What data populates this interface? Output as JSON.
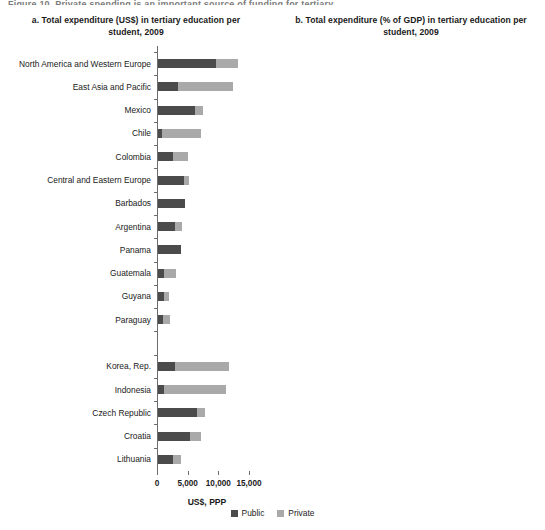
{
  "figure": {
    "top_cut_text": "Figure 10. Private spending is an important source of funding for tertiary education",
    "legend": [
      {
        "label": "Public",
        "color": "#4b4b4b",
        "key": "public"
      },
      {
        "label": "Private",
        "color": "#a9a9a9",
        "key": "private"
      }
    ]
  },
  "chart_data": [
    {
      "id": "panel-a",
      "type": "bar",
      "orientation": "horizontal",
      "stacked": true,
      "title": "a. Total expenditure (US$) in tertiary education per student, 2009",
      "xlabel": "US$, PPP",
      "ylabel": "",
      "xlim": [
        0,
        16300
      ],
      "xticks": [
        0,
        5000,
        10000,
        15000
      ],
      "xticklabels": [
        "0",
        "5,000",
        "10,000",
        "15,000"
      ],
      "grid": false,
      "legend_position": "bottom-center",
      "series": [
        {
          "name": "Public",
          "color": "#4b4b4b"
        },
        {
          "name": "Private",
          "color": "#a9a9a9"
        }
      ],
      "categories": [
        "North America and Western Europe",
        "East Asia and Pacific",
        "Mexico",
        "Chile",
        "Colombia",
        "Central and Eastern Europe",
        "Barbados",
        "Argentina",
        "Panama",
        "Guatemala",
        "Guyana",
        "Paraguay",
        "",
        "Korea, Rep.",
        "Indonesia",
        "Czech Republic",
        "Croatia",
        "Lithuania"
      ],
      "values": {
        "public": [
          9450,
          3250,
          5950,
          700,
          2400,
          4250,
          4350,
          2850,
          3750,
          1000,
          1050,
          800,
          0,
          2700,
          900,
          6400,
          5150,
          2450
        ],
        "private": [
          3600,
          9000,
          1350,
          6250,
          2550,
          750,
          0,
          1000,
          0,
          1950,
          700,
          1100,
          0,
          8800,
          10150,
          1200,
          1900,
          1350
        ]
      },
      "totals": [
        13050,
        12250,
        7300,
        6950,
        4950,
        5000,
        4350,
        3850,
        3750,
        2950,
        1750,
        1900,
        0,
        11500,
        11050,
        7600,
        7050,
        3800
      ]
    },
    {
      "id": "panel-b",
      "type": "bar",
      "orientation": "horizontal",
      "stacked": true,
      "title": "b. Total expenditure (% of GDP) in tertiary education per student, 2009",
      "xlabel": "% of GDP per capita",
      "ylabel": "",
      "xlim": [
        0,
        155
      ],
      "xticks": [
        0,
        50,
        100,
        150
      ],
      "xticklabels": [
        "0",
        "50",
        "100",
        "150"
      ],
      "grid": false,
      "legend_position": "bottom-center",
      "series": [
        {
          "name": "Public",
          "color": "#4b4b4b"
        },
        {
          "name": "Private",
          "color": "#a9a9a9"
        }
      ],
      "categories": [
        "East Asia and Pacific",
        "Colombia",
        "Mexico",
        "Guatemala",
        "Guyana",
        "Chile",
        "Paraguay",
        "North America and Western Europe",
        "Barbados",
        "Central and Eastern Europe",
        "Panama",
        "Argentina",
        "",
        "Indonesia",
        "Korea, Rep.",
        "Croatia",
        "Czech Republic",
        "Lithuania"
      ],
      "values": {
        "public": [
          14,
          23,
          34,
          13,
          18,
          5,
          16,
          22,
          24,
          11,
          19,
          13,
          0,
          14,
          9,
          24,
          22,
          13
        ],
        "private": [
          48,
          36,
          14,
          36,
          16,
          38,
          22,
          10,
          0,
          10,
          0,
          4,
          0,
          124,
          31,
          10,
          5,
          6
        ]
      },
      "totals": [
        62,
        59,
        48,
        49,
        34,
        43,
        38,
        32,
        24,
        21,
        19,
        17,
        0,
        138,
        40,
        34,
        27,
        19
      ]
    }
  ]
}
